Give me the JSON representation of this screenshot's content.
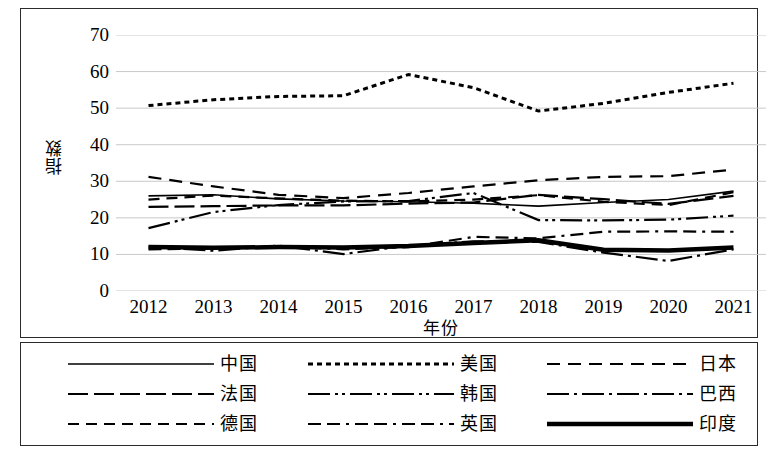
{
  "chart_data": {
    "type": "line",
    "title": "",
    "xlabel": "年份",
    "ylabel": "指数",
    "x": [
      2012,
      2013,
      2014,
      2015,
      2016,
      2017,
      2018,
      2019,
      2020,
      2021
    ],
    "xticklabels": [
      "2012",
      "2013",
      "2014",
      "2015",
      "2016",
      "2017",
      "2018",
      "2019",
      "2020",
      "2021"
    ],
    "yticklabels": [
      "0",
      "10",
      "20",
      "30",
      "40",
      "50",
      "60",
      "70"
    ],
    "ylim": [
      0,
      70
    ],
    "yticks": [
      0,
      10,
      20,
      30,
      40,
      50,
      60,
      70
    ],
    "grid": "horizontal",
    "legend_position": "bottom",
    "legend_columns": 3,
    "series": [
      {
        "name": "中国",
        "style": "solid",
        "width": 1.6,
        "values": [
          26.0,
          26.3,
          25.2,
          24.6,
          24.4,
          24.0,
          23.2,
          24.2,
          25.0,
          27.3
        ]
      },
      {
        "name": "美国",
        "style": "dotted",
        "width": 3.0,
        "values": [
          50.7,
          52.3,
          53.2,
          53.4,
          59.2,
          55.6,
          49.2,
          51.3,
          54.3,
          56.8
        ]
      },
      {
        "name": "日本",
        "style": "dashed",
        "width": 2.2,
        "values": [
          31.2,
          28.6,
          26.3,
          25.4,
          26.8,
          28.6,
          30.3,
          31.2,
          31.4,
          33.2
        ]
      },
      {
        "name": "法国",
        "style": "longdash",
        "width": 2.2,
        "values": [
          23.0,
          23.2,
          23.4,
          23.4,
          23.9,
          24.2,
          26.3,
          25.1,
          23.8,
          26.0
        ]
      },
      {
        "name": "韩国",
        "style": "dashdotdot",
        "width": 2.2,
        "values": [
          17.2,
          21.6,
          23.5,
          24.5,
          24.6,
          26.8,
          19.4,
          19.3,
          19.5,
          20.6
        ]
      },
      {
        "name": "巴西",
        "style": "dashdot",
        "width": 2.2,
        "values": [
          12.1,
          11.0,
          12.4,
          10.1,
          12.4,
          13.6,
          13.4,
          10.5,
          8.2,
          11.4
        ]
      },
      {
        "name": "德国",
        "style": "mediumdash",
        "width": 2.2,
        "values": [
          25.0,
          26.1,
          25.3,
          24.7,
          24.5,
          25.0,
          26.2,
          24.4,
          23.5,
          27.0
        ]
      },
      {
        "name": "英国",
        "style": "dashdashdot",
        "width": 2.2,
        "values": [
          11.4,
          11.6,
          12.2,
          11.4,
          12.0,
          14.8,
          14.4,
          16.2,
          16.3,
          16.2
        ]
      },
      {
        "name": "印度",
        "style": "thicksolid",
        "width": 4.5,
        "values": [
          12.0,
          11.8,
          12.0,
          11.9,
          12.3,
          13.1,
          13.9,
          11.3,
          11.1,
          11.9
        ]
      }
    ],
    "colors": {
      "line": "#000000",
      "grid": "#c9c9c9",
      "frame": "#2b2b2b",
      "background": "#ffffff"
    }
  },
  "legend": {
    "items": [
      {
        "label": "中国",
        "style": "solid"
      },
      {
        "label": "美国",
        "style": "dotted"
      },
      {
        "label": "日本",
        "style": "dashed"
      },
      {
        "label": "法国",
        "style": "longdash"
      },
      {
        "label": "韩国",
        "style": "dashdotdot"
      },
      {
        "label": "巴西",
        "style": "dashdot"
      },
      {
        "label": "德国",
        "style": "mediumdash"
      },
      {
        "label": "英国",
        "style": "dashdashdot"
      },
      {
        "label": "印度",
        "style": "thicksolid"
      }
    ]
  }
}
